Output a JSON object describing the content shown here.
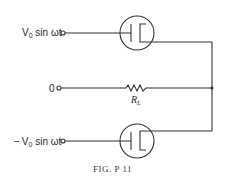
{
  "figure": {
    "caption": "Fig. P 11",
    "caption_display": "FIG. P 11"
  },
  "inputs": {
    "top": {
      "label_v": "V",
      "label_sub": "0",
      "label_rest": " sin ωt"
    },
    "middle": {
      "label": "0"
    },
    "bottom": {
      "label_sign": "−",
      "label_v": "V",
      "label_sub": "0",
      "label_rest": " sin ωt"
    }
  },
  "components": {
    "resistor": {
      "label": "R",
      "label_sub": "L"
    },
    "tube_top": {
      "type": "diode"
    },
    "tube_bottom": {
      "type": "diode"
    }
  },
  "colors": {
    "line": "#333333",
    "background": "#ffffff"
  }
}
